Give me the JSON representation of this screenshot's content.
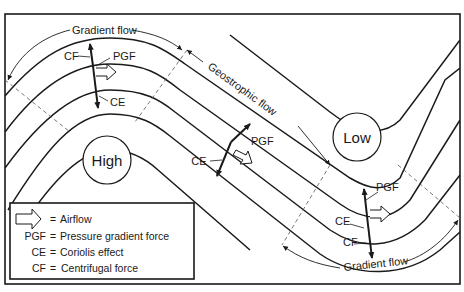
{
  "diagram": {
    "title_labels": {
      "gradient_flow_top": "Gradient flow",
      "geostrophic_flow": "Geostrophic flow",
      "gradient_flow_bottom": "Gradient flow"
    },
    "pressure_centers": {
      "high": "High",
      "low": "Low"
    },
    "force_labels_top": {
      "cf": "CF",
      "pgf": "PGF",
      "ce": "CE"
    },
    "force_labels_middle": {
      "pgf": "PGF",
      "ce": "CE"
    },
    "force_labels_bottom": {
      "pgf": "PGF",
      "ce": "CE",
      "cf": "CF"
    },
    "legend": {
      "items": [
        {
          "symbol": "airflow-arrow",
          "eq": "=",
          "text": "Airflow"
        },
        {
          "symbol": "PGF",
          "eq": "=",
          "text": "Pressure gradient force"
        },
        {
          "symbol": "CE",
          "eq": "=",
          "text": "Coriolis effect"
        },
        {
          "symbol": "CF",
          "eq": "=",
          "text": "Centrifugal force"
        }
      ]
    },
    "colors": {
      "ink": "#1a1a1a",
      "background": "#ffffff",
      "dashed": "#555555"
    }
  }
}
